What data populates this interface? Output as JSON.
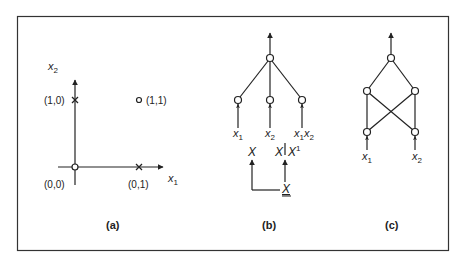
{
  "figure": {
    "frame_color": "#333333",
    "line_color": "#222222",
    "background": "#ffffff"
  },
  "panel_a": {
    "caption": "(a)",
    "axis_x_label": "x",
    "axis_x_sub": "1",
    "axis_y_label": "x",
    "axis_y_sub": "2",
    "points": [
      {
        "label": "(0,0)",
        "marker": "circle"
      },
      {
        "label": "(1,0)",
        "marker": "cross"
      },
      {
        "label": "(0,1)",
        "marker": "cross"
      },
      {
        "label": "(1,1)",
        "marker": "circle"
      }
    ]
  },
  "panel_b": {
    "caption": "(b)",
    "inputs": [
      {
        "var": "x",
        "sub": "1"
      },
      {
        "var": "x",
        "sub": "2"
      },
      {
        "var": "x",
        "sub": "1",
        "var2": "x",
        "sub2": "2"
      }
    ],
    "lower": {
      "left_label": "X",
      "right_label": "X",
      "right_label2": "X",
      "right_sup": "1",
      "bottom_label": "X"
    }
  },
  "panel_c": {
    "caption": "(c)",
    "inputs": [
      {
        "var": "x",
        "sub": "1"
      },
      {
        "var": "x",
        "sub": "2"
      }
    ]
  }
}
